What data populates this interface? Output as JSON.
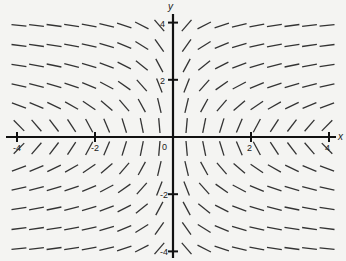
{
  "chart_data": {
    "type": "slope_field",
    "title": "",
    "equation_estimate": "dy/dx = 1/(x*y)",
    "xlabel": "x",
    "ylabel": "y",
    "xlim": [
      -4.2,
      4.2
    ],
    "ylim": [
      -4.1,
      4.1
    ],
    "grid": false,
    "x_ticks": [
      -4,
      -2,
      2,
      4
    ],
    "x_tick_labels": [
      "-4",
      "-2",
      "2",
      "4"
    ],
    "y_ticks": [
      4,
      2,
      -2,
      -4
    ],
    "y_tick_labels": [
      "4",
      "2",
      "-2",
      "-4"
    ],
    "origin_label": "0",
    "sample_x": [
      -3.95,
      -3.5,
      -3.05,
      -2.6,
      -2.15,
      -1.7,
      -1.25,
      -0.8,
      -0.35,
      0.35,
      0.8,
      1.25,
      1.7,
      2.15,
      2.6,
      3.05,
      3.5,
      3.95
    ],
    "sample_y": [
      3.9,
      3.2,
      2.5,
      1.8,
      1.1,
      0.4,
      -0.4,
      -1.1,
      -1.8,
      -2.5,
      -3.2,
      -3.9
    ],
    "segment_color": "#333333",
    "axis_color": "#111111"
  }
}
